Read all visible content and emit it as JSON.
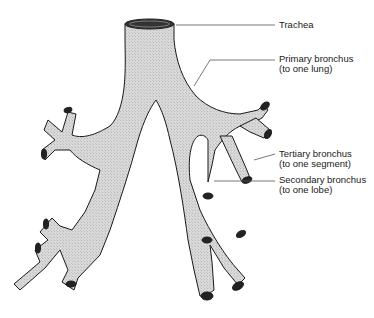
{
  "diagram": {
    "colors": {
      "airway_fill": "#d6d6d6",
      "outline": "#1a1a1a",
      "leader_line": "#555555",
      "lumen": "#222222"
    },
    "labels": [
      {
        "id": "trachea",
        "line1": "Trachea",
        "line2": ""
      },
      {
        "id": "primary-bronchus",
        "line1": "Primary bronchus",
        "line2": "(to one lung)"
      },
      {
        "id": "tertiary-bronchus",
        "line1": "Tertiary bronchus",
        "line2": "(to one segment)"
      },
      {
        "id": "secondary-bronchus",
        "line1": "Secondary bronchus",
        "line2": "(to one lobe)"
      }
    ]
  }
}
